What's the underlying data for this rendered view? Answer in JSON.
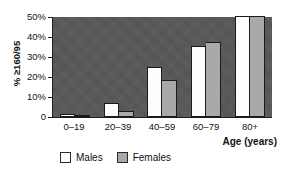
{
  "chart_data": {
    "type": "bar",
    "title": "",
    "xlabel": "Age (years)",
    "ylabel": "% ≥160/95",
    "categories": [
      "0–19",
      "20–39",
      "40–59",
      "60–79",
      "80+"
    ],
    "series": [
      {
        "name": "Males",
        "values": [
          1.5,
          7,
          25,
          35,
          50
        ],
        "color": "#ffffff"
      },
      {
        "name": "Females",
        "values": [
          0.8,
          3,
          18.5,
          37,
          50
        ],
        "color": "#a9a9a9"
      }
    ],
    "ylim": [
      0,
      50
    ],
    "yticks": [
      "0",
      "10%",
      "20%",
      "30%",
      "40%",
      "50%"
    ],
    "ytick_values": [
      0,
      10,
      20,
      30,
      40,
      50
    ],
    "grid": false,
    "legend_position": "bottom-left",
    "plot_background": "#585858"
  },
  "axes": {
    "y_title": "% ≥160/95",
    "x_title": "Age (years)",
    "y_tick_labels": [
      "50%",
      "40%",
      "30%",
      "20%",
      "10%",
      "0"
    ],
    "x_tick_labels": [
      "0–19",
      "20–39",
      "40–59",
      "60–79",
      "80+"
    ]
  },
  "legend": {
    "items": [
      {
        "label": "Males"
      },
      {
        "label": "Females"
      }
    ]
  }
}
